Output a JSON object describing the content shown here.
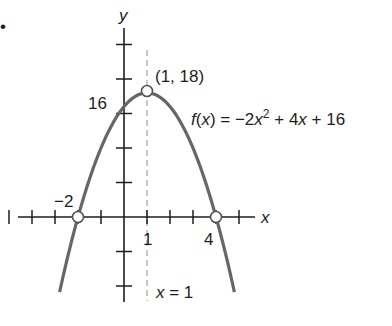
{
  "bullet": "•",
  "chart_data": {
    "type": "line",
    "title": "",
    "function_label": "f(x) = −2x² + 4x + 16",
    "function": {
      "a": -2,
      "b": 4,
      "c": 16
    },
    "xlabel": "x",
    "ylabel": "y",
    "xlim": [
      -5,
      5
    ],
    "ylim": [
      -10,
      25
    ],
    "x_tick_step": 1,
    "y_tick_step": 5,
    "grid": false,
    "curve_x_range": [
      -2.8,
      4.8
    ],
    "points": [
      {
        "x": 1,
        "y": 18,
        "label": "(1, 18)",
        "kind": "vertex"
      },
      {
        "x": -2,
        "y": 0,
        "label": "−2",
        "kind": "x-intercept"
      },
      {
        "x": 4,
        "y": 0,
        "label": "4",
        "kind": "x-intercept"
      }
    ],
    "annotations": [
      {
        "text": "16",
        "at": {
          "x": 0,
          "y": 16
        },
        "kind": "y-intercept label"
      },
      {
        "text": "1",
        "at": {
          "x": 1,
          "y": 0
        },
        "kind": "tick label"
      },
      {
        "text": "x = 1",
        "kind": "axis of symmetry",
        "style": "dashed"
      }
    ]
  },
  "labels": {
    "y_axis": "y",
    "x_axis": "x",
    "vertex": "(1, 18)",
    "y_intercept": "16",
    "root_left": "−2",
    "root_right": "4",
    "tick_one": "1",
    "axis_sym_lhs": "x",
    "axis_sym_rhs": " = 1",
    "fx_f": "f",
    "fx_paren": "(",
    "fx_x": "x",
    "fx_mid": ") = −2",
    "fx_x2": "x",
    "fx_sup": "2",
    "fx_plus4": " + 4",
    "fx_x3": "x",
    "fx_tail": " + 16"
  }
}
